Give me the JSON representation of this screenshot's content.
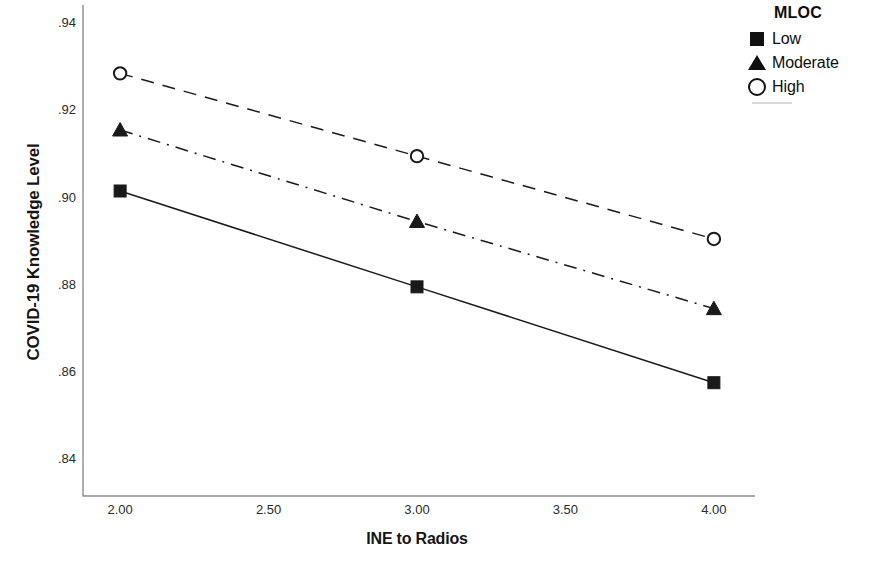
{
  "chart_data": {
    "type": "line",
    "title": "",
    "xlabel": "INE to Radios",
    "ylabel": "COVID-19 Knowledge Level",
    "x": [
      2.0,
      3.0,
      4.0
    ],
    "xtick_labels": [
      "2.00",
      "2.50",
      "3.00",
      "3.50",
      "4.00"
    ],
    "xtick_values": [
      2.0,
      2.5,
      3.0,
      3.5,
      4.0
    ],
    "ytick_labels": [
      ".94",
      ".92",
      ".90",
      ".88",
      ".86",
      ".84"
    ],
    "ytick_values": [
      0.94,
      0.92,
      0.9,
      0.88,
      0.86,
      0.84
    ],
    "xlim": [
      1.875,
      4.125
    ],
    "ylim": [
      0.8315,
      0.9435
    ],
    "grid": false,
    "legend_position": "right",
    "legend_title": "MLOC",
    "series": [
      {
        "name": "Low",
        "marker": "filled-square",
        "linestyle": "solid",
        "color": "#1a1a1a",
        "values": [
          0.9015,
          0.8795,
          0.8575
        ]
      },
      {
        "name": "Moderate",
        "marker": "filled-triangle",
        "linestyle": "dashdot",
        "color": "#1a1a1a",
        "values": [
          0.9155,
          0.8945,
          0.8745
        ]
      },
      {
        "name": "High",
        "marker": "open-circle",
        "linestyle": "dashed",
        "color": "#1a1a1a",
        "values": [
          0.9285,
          0.9095,
          0.8905
        ]
      }
    ]
  },
  "legend": {
    "title": "MLOC",
    "items": [
      {
        "label": "Low",
        "marker": "filled-square"
      },
      {
        "label": "Moderate",
        "marker": "filled-triangle"
      },
      {
        "label": "High",
        "marker": "open-circle"
      }
    ]
  },
  "axes": {
    "y_title": "COVID-19 Knowledge Level",
    "x_title": "INE to Radios"
  }
}
